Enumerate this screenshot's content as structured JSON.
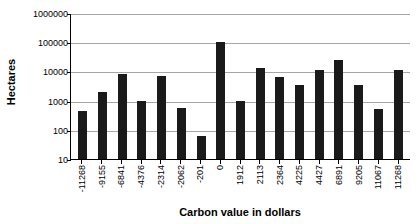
{
  "chart_data": {
    "type": "bar",
    "title": "",
    "xlabel": "Carbon value in dollars",
    "ylabel": "Hectares",
    "yscale": "log",
    "ylim": [
      10,
      1000000
    ],
    "yticks": [
      10,
      100,
      1000,
      10000,
      100000,
      1000000
    ],
    "ytick_labels": [
      "10",
      "100",
      "1000",
      "10000",
      "100000",
      "1000000"
    ],
    "grid": true,
    "legend": false,
    "bar_color": "#1a1a1a",
    "categories": [
      "-11268",
      "-9155",
      "-6841",
      "-4376",
      "-2314",
      "-2062",
      "-201",
      "0",
      "1912",
      "2113",
      "2364",
      "4225",
      "4427",
      "6891",
      "9205",
      "11067",
      "11268"
    ],
    "values": [
      450,
      1900,
      8000,
      1000,
      7000,
      550,
      60,
      100000,
      1000,
      13000,
      6500,
      3300,
      11000,
      25000,
      3300,
      500,
      11000
    ]
  }
}
